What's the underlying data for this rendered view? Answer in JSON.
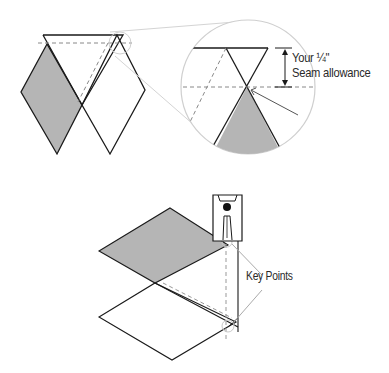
{
  "diagram": {
    "top_section": {
      "annotation_line1": "Your ¼\"",
      "annotation_line2": "Seam allowance",
      "callout": "magnified-circle-detail"
    },
    "bottom_section": {
      "annotation": "Key Points",
      "illustration": "presser-foot-alignment"
    },
    "colors": {
      "shaded_fill": "#b5b5b5",
      "outline": "#1a1a1a",
      "dashed": "#888888",
      "callout_circle": "#cfcfcf"
    }
  }
}
